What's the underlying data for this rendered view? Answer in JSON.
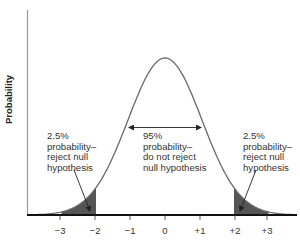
{
  "chart_data": {
    "type": "area",
    "title": "",
    "xlabel": "",
    "ylabel": "Probability",
    "distribution": "standard normal (two-tailed test)",
    "x_ticks": [
      "−3",
      "−2",
      "−1",
      "0",
      "+1",
      "+2",
      "+3"
    ],
    "x_tick_values": [
      -3,
      -2,
      -1,
      0,
      1,
      2,
      3
    ],
    "xlim": [
      -3.9,
      3.8
    ],
    "grid": false,
    "legend": null,
    "regions": [
      {
        "name": "left-rejection-tail",
        "from": -3,
        "to": -2,
        "probability_pct": 2.5,
        "shaded": true,
        "color": "#555555"
      },
      {
        "name": "acceptance-region",
        "from": -2,
        "to": 2,
        "probability_pct": 95,
        "shaded": false
      },
      {
        "name": "right-rejection-tail",
        "from": 2,
        "to": 3,
        "probability_pct": 2.5,
        "shaded": true,
        "color": "#555555"
      }
    ],
    "annotations": [
      {
        "id": "left",
        "lines": [
          "2.5%",
          "probability–",
          "reject null",
          "hypothesis"
        ]
      },
      {
        "id": "center",
        "lines": [
          "95%",
          "probability–",
          "do not reject",
          "null hypothesis"
        ]
      },
      {
        "id": "right",
        "lines": [
          "2.5%",
          "probability–",
          "reject null",
          "hypothesis"
        ]
      }
    ],
    "colors": {
      "curve": "#6a6a6a",
      "tail_fill": "#555555",
      "axis": "#111111",
      "y_axis": "#999999"
    }
  },
  "labels": {
    "y_axis": "Probability",
    "left": "2.5%\nprobability–\nreject null\nhypothesis",
    "center": "95%\nprobability–\ndo not reject\nnull hypothesis",
    "right": "2.5%\nprobability–\nreject null\nhypothesis",
    "ticks": [
      "−3",
      "−2",
      "−1",
      "0",
      "+1",
      "+2",
      "+3"
    ]
  }
}
